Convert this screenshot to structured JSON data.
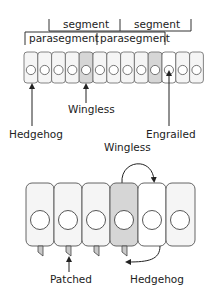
{
  "colors": {
    "cell_fill": "#f5f5f5",
    "cell_fill_white": "#ffffff",
    "cell_fill_shaded": "#d6d6d6",
    "stroke": "#555555",
    "text": "#222222"
  },
  "top_diagram": {
    "segment_labels": [
      "segment",
      "segment"
    ],
    "parasegment_labels": [
      "parasegment",
      "parasegment"
    ],
    "cell_count": 13,
    "shaded_cells": [
      5,
      11
    ],
    "white_cells": [
      12
    ],
    "callouts": {
      "hedgehog": "Hedgehog",
      "wingless": "Wingless",
      "engrailed": "Engrailed"
    }
  },
  "bottom_diagram": {
    "cell_count": 6,
    "shaded_cells": [
      4
    ],
    "white_cells": [
      5
    ],
    "labels": {
      "wingless": "Wingless",
      "patched": "Patched",
      "hedgehog": "Hedgehog"
    }
  }
}
